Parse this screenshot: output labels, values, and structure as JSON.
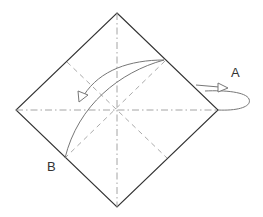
{
  "diagram": {
    "type": "origami-fold-instruction",
    "labels": {
      "a": "A",
      "b": "B"
    },
    "square": {
      "top": [
        117,
        13
      ],
      "right": [
        218,
        110
      ],
      "bottom": [
        117,
        207
      ],
      "left": [
        16,
        110
      ]
    },
    "crease_lines": {
      "mountain_vertical": "dash-dot",
      "mountain_horizontal": "dash-dot",
      "valley_diagonals": "dashed"
    },
    "colors": {
      "edge": "#333333",
      "crease": "#999999",
      "arrow": "#777777"
    }
  }
}
